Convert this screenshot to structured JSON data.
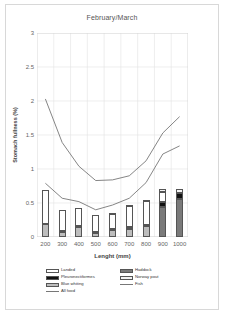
{
  "chart": {
    "title": "February/March",
    "xlabel": "Lenght (mm)",
    "ylabel": "Stomach fullness (%)"
  },
  "legend": {
    "entries": [
      {
        "label": "Landed",
        "type": "swatch",
        "color": "#ffffff",
        "column": "left"
      },
      {
        "label": "Pleuronectiformes",
        "type": "swatch",
        "color": "#111111",
        "column": "left"
      },
      {
        "label": "Blue whiting",
        "type": "swatch",
        "color": "#bdbdbd",
        "column": "left"
      },
      {
        "label": "All food",
        "type": "line",
        "color": "#777777",
        "column": "left"
      },
      {
        "label": "Haddock",
        "type": "swatch",
        "color": "#7a7a7a",
        "column": "right"
      },
      {
        "label": "Norway pout",
        "type": "swatch",
        "color": "#f2f2f2",
        "column": "right"
      },
      {
        "label": "Fish",
        "type": "line",
        "color": "#777777",
        "column": "right"
      }
    ]
  },
  "chart_data": {
    "type": "bar",
    "title": "February/March",
    "xlabel": "Lenght (mm)",
    "ylabel": "Stomach fullness (%)",
    "categories": [
      "200",
      "300",
      "400",
      "500",
      "600",
      "700",
      "800",
      "900",
      "1000"
    ],
    "ylim": [
      0,
      3
    ],
    "yticks": [
      0,
      0.5,
      1,
      1.5,
      2,
      2.5,
      3
    ],
    "grid": true,
    "legend_position": "bottom",
    "stacked": true,
    "series": [
      {
        "name": "Blue whiting",
        "color": "#bdbdbd",
        "values": [
          0.19,
          0.08,
          0.15,
          0.07,
          0.1,
          0.12,
          0.17,
          0.0,
          0.0
        ]
      },
      {
        "name": "Pleuronectiformes",
        "color": "#111111",
        "values": [
          0.0,
          0.01,
          0.01,
          0.01,
          0.02,
          0.03,
          0.01,
          0.0,
          0.0
        ]
      },
      {
        "name": "Haddock",
        "color": "#7a7a7a",
        "values": [
          0.0,
          0.0,
          0.0,
          0.0,
          0.0,
          0.0,
          0.0,
          0.44,
          0.56
        ]
      },
      {
        "name": "Pleuronectiformes2",
        "color": "#111111",
        "values": [
          0.0,
          0.0,
          0.0,
          0.0,
          0.0,
          0.0,
          0.0,
          0.08,
          0.08
        ]
      },
      {
        "name": "Landed",
        "color": "#ffffff",
        "values": [
          0.5,
          0.31,
          0.27,
          0.25,
          0.22,
          0.31,
          0.35,
          0.14,
          0.0
        ]
      },
      {
        "name": "Norway pout",
        "color": "#f2f2f2",
        "values": [
          0.0,
          0.0,
          0.0,
          0.0,
          0.01,
          0.01,
          0.01,
          0.05,
          0.07
        ]
      }
    ],
    "lines": [
      {
        "name": "All food",
        "color": "#777777",
        "values": [
          2.03,
          1.39,
          1.04,
          0.83,
          0.84,
          0.9,
          1.12,
          1.53,
          1.77
        ]
      },
      {
        "name": "Fish",
        "color": "#777777",
        "values": [
          0.79,
          0.57,
          0.52,
          0.4,
          0.47,
          0.57,
          0.8,
          1.22,
          1.34
        ]
      }
    ]
  }
}
